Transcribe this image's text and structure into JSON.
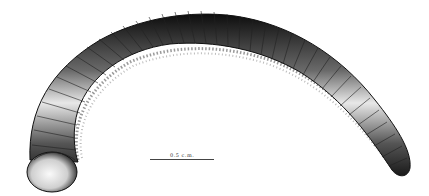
{
  "figure": {
    "style": "pen-and-ink scientific drawing",
    "colors": {
      "ink": "#111111",
      "highlight": "#f2f2f2",
      "background": "#ffffff"
    },
    "scale_bar": {
      "label": "0.5 c.m."
    }
  }
}
